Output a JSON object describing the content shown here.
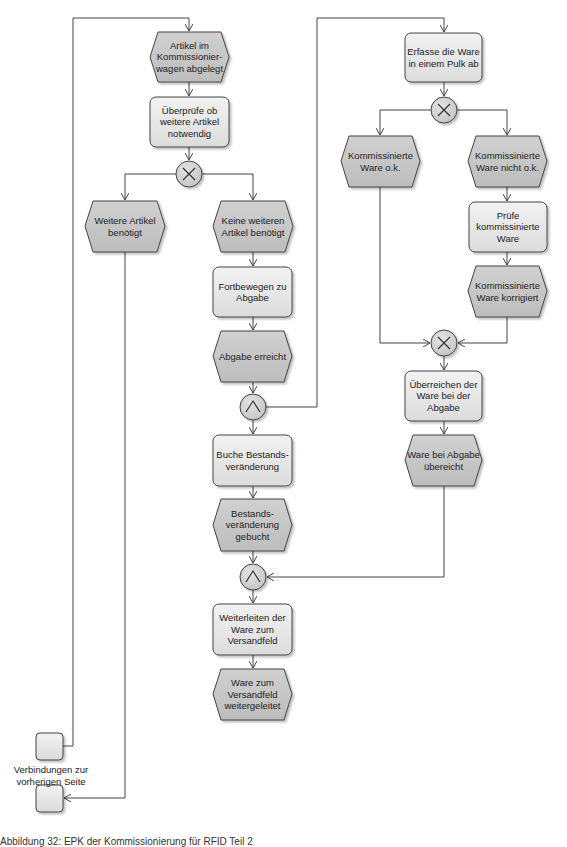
{
  "diagram": {
    "type": "EPK (Ereignisgesteuerte Prozesskette)",
    "colors": {
      "event_fill": "#c6c6c6",
      "function_fill": "#e8e8e8",
      "connector_fill": "#d4d4d4",
      "stroke": "#444444"
    },
    "events": {
      "e1": "Artikel im\nKommissionier-\nwagen abgelegt",
      "e2": "Weitere Artikel\nbenötigt",
      "e3": "Keine weiteren\nArtikel benötigt",
      "e4": "Abgabe erreicht",
      "e5": "Kommissinierte\nWare o.k.",
      "e6": "Kommissinierte\nWare nicht o.k.",
      "e7": "Kommissinierte\nWare korrigiert",
      "e8": "Ware bei Abgabe\nübereicht",
      "e9": "Bestands-\nveränderung\ngebucht",
      "e10": "Ware zum\nVersandfeld\nweitergeleitet"
    },
    "functions": {
      "f1": "Überprüfe ob\nweitere Artikel\nnotwendig",
      "f2": "Fortbewegen zu\nAbgabe",
      "f3": "Erfasse die Ware\nin einem Pulk ab",
      "f4": "Prüfe\nkommissinierte\nWare",
      "f5": "Überreichen der\nWare bei der\nAbgabe",
      "f6": "Buche Bestands-\nveränderung",
      "f7": "Weiterleiten der\nWare zum\nVersandfeld"
    },
    "operators": {
      "xor1": "XOR",
      "xor2": "XOR",
      "xor3": "XOR",
      "and1": "AND",
      "and2": "AND"
    },
    "page_connector_label": "Verbindungen zur\nvorherigen Seite"
  },
  "caption": "Abbildung 32: EPK der Kommissionierung für RFID Teil 2"
}
